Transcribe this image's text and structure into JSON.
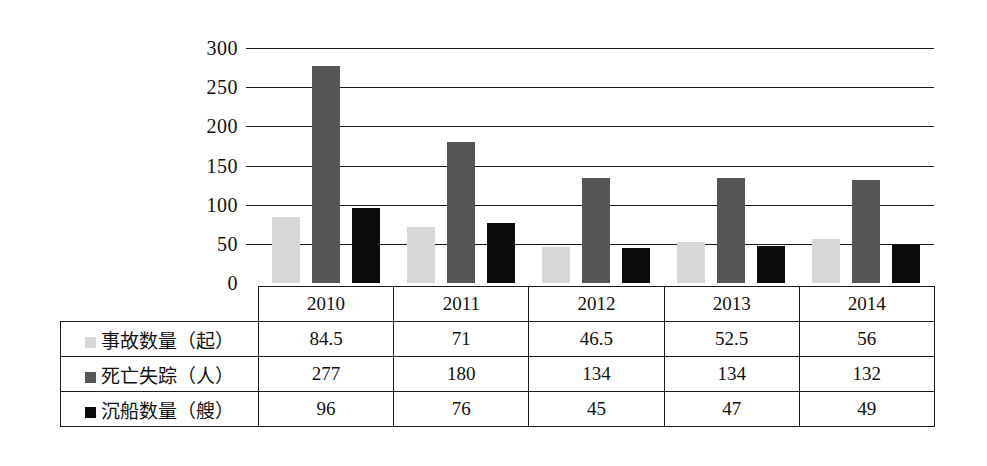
{
  "chart_data": {
    "type": "bar",
    "title": "",
    "xlabel": "",
    "ylabel": "",
    "grid": true,
    "legend_position": "table-row-labels",
    "categories": [
      "2010",
      "2011",
      "2012",
      "2013",
      "2014"
    ],
    "ylim": [
      0,
      300
    ],
    "yticks": [
      0,
      50,
      100,
      150,
      200,
      250,
      300
    ],
    "ytick_labels": [
      "0",
      "50",
      "100",
      "150",
      "200",
      "250",
      "300"
    ],
    "series": [
      {
        "name": "事故数量（起）",
        "color": "#d8d8d8",
        "swatch": "accidents",
        "values": [
          84.5,
          71,
          46.5,
          52.5,
          56
        ],
        "display_values": [
          "84.5",
          "71",
          "46.5",
          "52.5",
          "56"
        ]
      },
      {
        "name": "死亡失踪（人）",
        "color": "#555555",
        "swatch": "deaths",
        "values": [
          277,
          180,
          134,
          134,
          132
        ],
        "display_values": [
          "277",
          "180",
          "134",
          "134",
          "132"
        ]
      },
      {
        "name": "沉船数量（艘）",
        "color": "#0b0b0b",
        "swatch": "sinkings",
        "values": [
          96,
          76,
          45,
          47,
          49
        ],
        "display_values": [
          "96",
          "76",
          "45",
          "47",
          "49"
        ]
      }
    ]
  },
  "table": {
    "year_headers": [
      "2010",
      "2011",
      "2012",
      "2013",
      "2014"
    ],
    "rows": [
      {
        "label": "事故数量（起）",
        "swatch": "accidents",
        "cells": [
          "84.5",
          "71",
          "46.5",
          "52.5",
          "56"
        ]
      },
      {
        "label": "死亡失踪（人）",
        "swatch": "deaths",
        "cells": [
          "277",
          "180",
          "134",
          "134",
          "132"
        ]
      },
      {
        "label": "沉船数量（艘）",
        "swatch": "sinkings",
        "cells": [
          "96",
          "76",
          "45",
          "47",
          "49"
        ]
      }
    ]
  },
  "colors": {
    "accidents": "#d8d8d8",
    "deaths": "#555555",
    "sinkings": "#0b0b0b",
    "axis": "#1a1a1a",
    "background": "#ffffff"
  }
}
